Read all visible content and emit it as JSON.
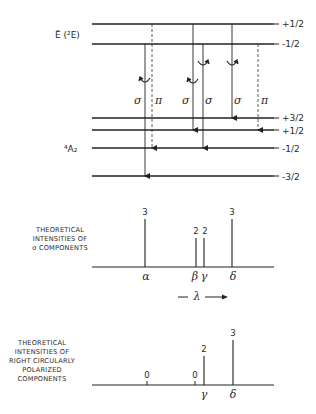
{
  "energy_diagram": {
    "upper_state_label": "Ē (²E)",
    "upper_levels": [
      {
        "label": "+1/2",
        "y": 24
      },
      {
        "label": "-1/2",
        "y": 44
      }
    ],
    "lower_state_label": "⁴A₂",
    "lower_levels": [
      {
        "label": "+3/2",
        "y": 118
      },
      {
        "label": "+1/2",
        "y": 130
      },
      {
        "label": "-1/2",
        "y": 148
      },
      {
        "label": "-3/2",
        "y": 176
      }
    ],
    "transitions": [
      {
        "polarization": "σ",
        "from": "-1/2",
        "to": "-3/2",
        "style": "solid",
        "x": 145,
        "circular": "left"
      },
      {
        "polarization": "π",
        "from": "+1/2",
        "to": "-1/2",
        "style": "dashed",
        "x": 152
      },
      {
        "polarization": "σ",
        "from": "+1/2",
        "to": "+1/2",
        "style": "solid",
        "x": 193,
        "circular": "left"
      },
      {
        "polarization": "σ",
        "from": "-1/2",
        "to": "-1/2",
        "style": "solid",
        "x": 203,
        "circular": "right"
      },
      {
        "polarization": "σ",
        "from": "+1/2",
        "to": "+3/2",
        "style": "solid",
        "x": 232,
        "circular": "right"
      },
      {
        "polarization": "π",
        "from": "-1/2",
        "to": "+1/2",
        "style": "dashed",
        "x": 258
      }
    ]
  },
  "sigma_spectrum": {
    "caption": [
      "THEORETICAL",
      "INTENSITIES OF",
      "σ COMPONENTS"
    ],
    "lines": [
      {
        "name": "α",
        "intensity": 3,
        "x": 145
      },
      {
        "name": "β",
        "intensity": 2,
        "x": 196
      },
      {
        "name": "γ",
        "intensity": 2,
        "x": 204
      },
      {
        "name": "δ",
        "intensity": 3,
        "x": 232
      }
    ],
    "wavelength_label": "λ"
  },
  "rcp_spectrum": {
    "caption": [
      "THEORETICAL",
      "INTENSITIES OF",
      "RIGHT CIRCULARLY",
      "POLARIZED",
      "COMPONENTS"
    ],
    "lines": [
      {
        "name": "",
        "intensity": 0,
        "x": 147
      },
      {
        "name": "",
        "intensity": 0,
        "x": 195
      },
      {
        "name": "γ",
        "intensity": 2,
        "x": 204
      },
      {
        "name": "δ",
        "intensity": 3,
        "x": 233
      }
    ]
  },
  "text": {
    "upper_label": "Ē (²E)",
    "lower_label": "⁴A₂",
    "up_half": "+1/2",
    "dn_half": "-1/2",
    "up_three": "+3/2",
    "dn_three": "-3/2",
    "sigma": "σ",
    "pi": "π",
    "alpha": "α",
    "beta": "β",
    "gamma": "γ",
    "delta": "δ",
    "lambda": "λ",
    "three": "3",
    "two": "2",
    "zero": "0",
    "cap1_l1": "THEORETICAL",
    "cap1_l2": "INTENSITIES OF",
    "cap1_l3": "σ COMPONENTS",
    "cap2_l1": "THEORETICAL",
    "cap2_l2": "INTENSITIES OF",
    "cap2_l3": "RIGHT CIRCULARLY",
    "cap2_l4": "POLARIZED",
    "cap2_l5": "COMPONENTS"
  }
}
